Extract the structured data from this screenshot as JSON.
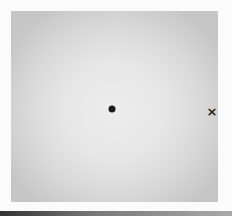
{
  "figure": {
    "header_fragment": "",
    "panel": {
      "background": "radial-gray-gradient",
      "colors": {
        "center": "#ececec",
        "edge": "#c6c6c6"
      }
    },
    "markers": [
      {
        "type": "dot",
        "icon": "filled-circle",
        "x": 112,
        "y": 109,
        "color": "#1c1c1c"
      },
      {
        "type": "cross",
        "icon": "x-mark",
        "label": "×",
        "x": 212,
        "y": 111,
        "color": "#222222"
      }
    ]
  }
}
